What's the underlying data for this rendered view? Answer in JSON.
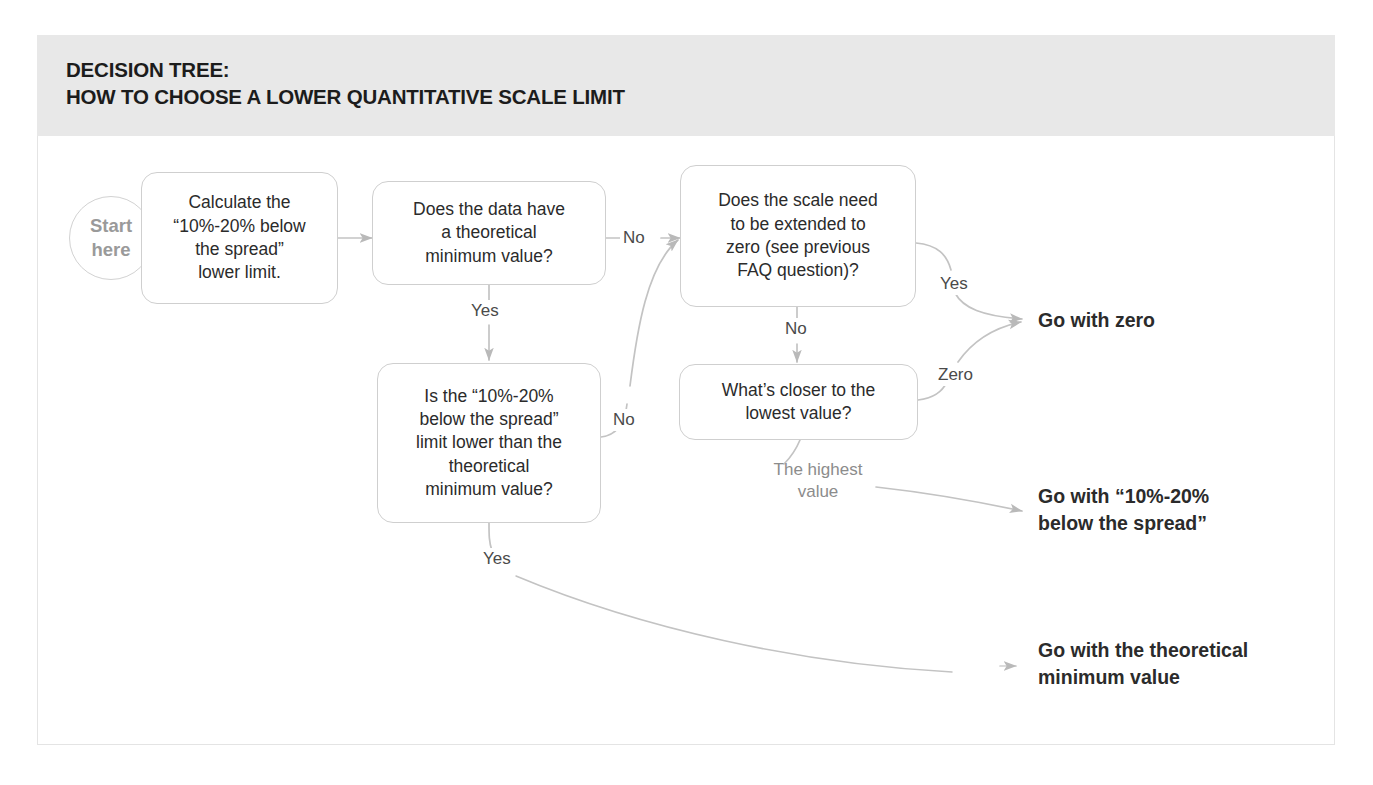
{
  "header": {
    "title": "DECISION TREE:\nHOW TO CHOOSE A LOWER QUANTITATIVE SCALE LIMIT"
  },
  "colors": {
    "header_band": "#e8e8e8",
    "card_border": "#e4e4e4",
    "node_border": "#cfcfcf",
    "node_text": "#2b2b2b",
    "edge_line": "#bdbdbd",
    "start_text": "#9a9a9a",
    "muted_label": "#8c8c8c",
    "page_background": "#ffffff"
  },
  "start": {
    "label": "Start\nhere"
  },
  "nodes": [
    {
      "id": "calculate",
      "label": "Calculate the\n“10%-20% below\nthe spread”\nlower limit."
    },
    {
      "id": "has-min",
      "label": "Does the data have\na theoretical\nminimum value?"
    },
    {
      "id": "extend-zero",
      "label": "Does the scale need\nto be extended to\nzero (see previous\nFAQ question)?"
    },
    {
      "id": "limit-lower",
      "label": "Is the “10%-20%\nbelow the spread”\nlimit lower than the\ntheoretical\nminimum value?"
    },
    {
      "id": "whats-closer",
      "label": "What’s closer to the\nlowest value?"
    }
  ],
  "edge_labels": [
    {
      "id": "no-top",
      "text": "No"
    },
    {
      "id": "yes-down",
      "text": "Yes"
    },
    {
      "id": "no-curve-up",
      "text": "No"
    },
    {
      "id": "no-to-closer",
      "text": "No"
    },
    {
      "id": "yes-to-zero",
      "text": "Yes"
    },
    {
      "id": "zero-to-zero",
      "text": "Zero"
    },
    {
      "id": "highest-value",
      "text": "The highest\nvalue"
    },
    {
      "id": "yes-to-theoretical",
      "text": "Yes"
    }
  ],
  "outcomes": [
    {
      "id": "go-zero",
      "label": "Go with zero"
    },
    {
      "id": "go-spread",
      "label": "Go with “10%-20%\nbelow the spread”"
    },
    {
      "id": "go-theoretical",
      "label": "Go with the theoretical\nminimum value"
    }
  ]
}
